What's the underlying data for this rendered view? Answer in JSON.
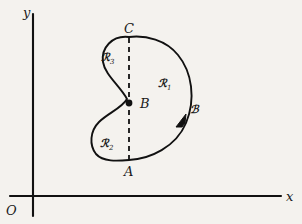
{
  "figure": {
    "axes": {
      "y_label": "y",
      "x_label": "x",
      "origin_label": "O"
    },
    "points": [
      {
        "id": "A",
        "label": "A",
        "x": 129,
        "y": 160,
        "role": "bottom-chord-endpoint",
        "marked": false
      },
      {
        "id": "B",
        "label": "B",
        "x": 129,
        "y": 103,
        "role": "interior-junction",
        "marked": true
      },
      {
        "id": "C",
        "label": "C",
        "x": 129,
        "y": 37,
        "role": "top-chord-endpoint",
        "marked": false
      }
    ],
    "regions": [
      {
        "id": "R1",
        "label": "ℛ",
        "subscript": "1",
        "description": "right region of the bean"
      },
      {
        "id": "R2",
        "label": "ℛ",
        "subscript": "2",
        "description": "lower-left region of the bean"
      },
      {
        "id": "R3",
        "label": "ℛ",
        "subscript": "3",
        "description": "upper-left region of the bean"
      }
    ],
    "curve": {
      "label": "ℬ",
      "name": "boundary-curve",
      "orientation": "counterclockwise",
      "arrow_direction": "up-right",
      "style": "solid",
      "color": "#111111"
    },
    "chord": {
      "name": "chord-ABC",
      "style": "dashed",
      "color": "#111111",
      "from": "A",
      "through": "B",
      "to": "C"
    },
    "colors": {
      "ink": "#111111",
      "paper": "#f4f2ee"
    }
  }
}
